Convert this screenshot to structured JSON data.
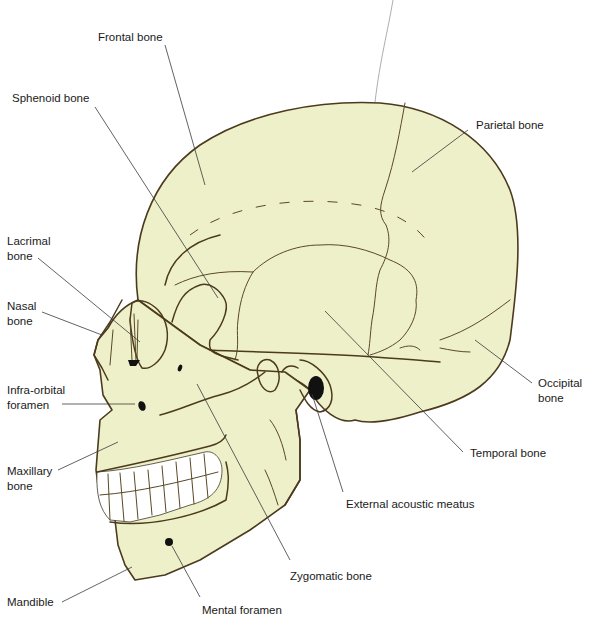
{
  "diagram": {
    "colors": {
      "bone_fill": "#eef0c9",
      "outline": "#4b3a1e",
      "leader_line": "#3a3a3a",
      "label_text": "#1a1a1a",
      "background": "#ffffff"
    },
    "labels": [
      {
        "id": "frontal",
        "text": "Frontal bone",
        "x": 98,
        "y": 30
      },
      {
        "id": "sphenoid",
        "text": "Sphenoid bone",
        "x": 12,
        "y": 91
      },
      {
        "id": "parietal",
        "text": "Parietal bone",
        "x": 476,
        "y": 118
      },
      {
        "id": "lacrimal",
        "text": "Lacrimal\nbone",
        "x": 7,
        "y": 234
      },
      {
        "id": "nasal",
        "text": "Nasal\nbone",
        "x": 7,
        "y": 299
      },
      {
        "id": "infraorbital",
        "text": "Infra-orbital\nforamen",
        "x": 7,
        "y": 383
      },
      {
        "id": "occipital",
        "text": "Occipital\nbone",
        "x": 538,
        "y": 376
      },
      {
        "id": "temporal",
        "text": "Temporal bone",
        "x": 470,
        "y": 446
      },
      {
        "id": "maxillary",
        "text": "Maxillary\nbone",
        "x": 7,
        "y": 464
      },
      {
        "id": "eam",
        "text": "External acoustic meatus",
        "x": 346,
        "y": 497
      },
      {
        "id": "zygomatic",
        "text": "Zygomatic bone",
        "x": 290,
        "y": 569
      },
      {
        "id": "mandible",
        "text": "Mandible",
        "x": 7,
        "y": 595
      },
      {
        "id": "mental",
        "text": "Mental foramen",
        "x": 202,
        "y": 603
      }
    ]
  }
}
